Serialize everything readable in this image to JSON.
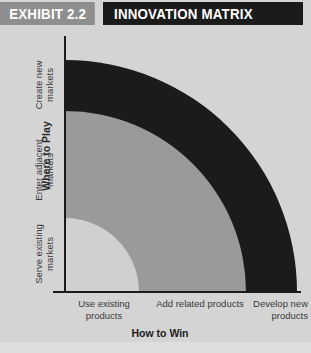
{
  "exhibit": {
    "tag": "EXHIBIT 2.2",
    "title": "INNOVATION MATRIX"
  },
  "chart_data": {
    "type": "heatmap",
    "title": "INNOVATION MATRIX",
    "xlabel": "How to Win",
    "ylabel": "Where to Play",
    "x_categories": [
      "Use existing products",
      "Add related products",
      "Develop new products"
    ],
    "y_categories": [
      "Serve existing markets",
      "Enter adjacent markets",
      "Create new markets"
    ],
    "grid": false,
    "legend": "none",
    "bands": [
      {
        "name": "core",
        "color": "#d0d0d0",
        "radius_fraction": 0.32
      },
      {
        "name": "adjacent",
        "color": "#9a9a9a",
        "radius_fraction": 0.78
      },
      {
        "name": "transformational",
        "color": "#1b1b1b",
        "radius_fraction": 1.0
      }
    ]
  },
  "axes": {
    "y": {
      "title": "Where to Play",
      "ticks": [
        {
          "label": "Create new\nmarkets"
        },
        {
          "label": "Enter adjacent\nmarkets"
        },
        {
          "label": "Serve existing\nmarkets"
        }
      ]
    },
    "x": {
      "title": "How to Win",
      "ticks": [
        {
          "label": "Use existing\nproducts"
        },
        {
          "label": "Add related products"
        },
        {
          "label": "Develop new\nproducts"
        }
      ]
    }
  },
  "colors": {
    "background": "#d4d4d4",
    "tag_background": "#8e8e8e",
    "title_background": "#1b1b1b",
    "band_outer": "#1b1b1b",
    "band_mid": "#9a9a9a",
    "band_inner": "#d0d0d0",
    "axis": "#1b1b1b",
    "text": "#3a3a3a"
  }
}
